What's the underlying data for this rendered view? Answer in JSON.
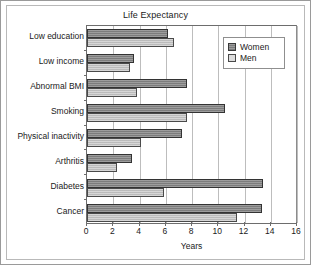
{
  "chart_data": {
    "type": "bar",
    "orientation": "horizontal",
    "title": "Life Expectancy",
    "xlabel": "Years",
    "ylabel": "",
    "xlim": [
      0,
      16
    ],
    "xticks": [
      0,
      2,
      4,
      6,
      8,
      10,
      12,
      14,
      16
    ],
    "grid": true,
    "grid_axis": "x",
    "legend_position": "top-right",
    "categories": [
      "Low education",
      "Low income",
      "Abnormal BMI",
      "Smoking",
      "Physical inactivity",
      "Arthritis",
      "Diabetes",
      "Cancer"
    ],
    "series": [
      {
        "name": "Women",
        "color": "#8a8a8a",
        "values": [
          6.2,
          3.6,
          7.6,
          10.5,
          7.2,
          3.4,
          13.4,
          13.3
        ]
      },
      {
        "name": "Men",
        "color": "#c6c6c6",
        "values": [
          6.6,
          3.3,
          3.8,
          7.6,
          4.1,
          2.3,
          5.9,
          11.4
        ]
      }
    ]
  },
  "legend": {
    "items": [
      {
        "label": "Women",
        "swatch": "women"
      },
      {
        "label": "Men",
        "swatch": "men"
      }
    ]
  }
}
